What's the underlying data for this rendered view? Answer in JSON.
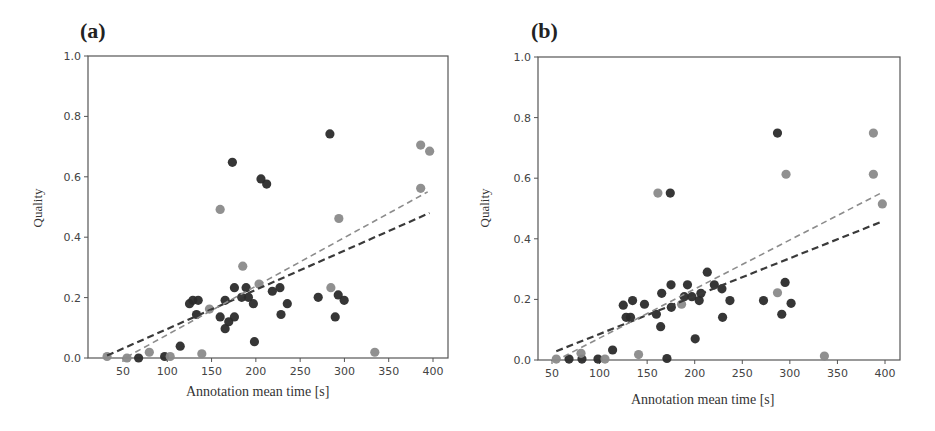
{
  "figure": {
    "panels": [
      {
        "label": "(a)",
        "xlabel": "Annotation mean time [s]",
        "ylabel": "Quality"
      },
      {
        "label": "(b)",
        "xlabel": "Annotation mean time [s]",
        "ylabel": "Quality"
      }
    ]
  },
  "colors": {
    "dark": "#2b2b2b",
    "gray": "#8a8a8a",
    "axis": "#555555"
  },
  "chart_data": [
    {
      "type": "scatter",
      "title": "(a)",
      "xlabel": "Annotation mean time [s]",
      "ylabel": "Quality",
      "xlim": [
        20,
        415
      ],
      "ylim": [
        0.0,
        1.0
      ],
      "xticks": [
        50,
        100,
        150,
        200,
        250,
        300,
        350,
        400
      ],
      "yticks": [
        0.0,
        0.2,
        0.4,
        0.6,
        0.8,
        1.0
      ],
      "grid": false,
      "legend": null,
      "series": [
        {
          "name": "dark",
          "points": [
            [
              283.6,
              0.742
            ],
            [
              173.5,
              0.648
            ],
            [
              205.8,
              0.593
            ],
            [
              212.2,
              0.576
            ],
            [
              114.6,
              0.039
            ],
            [
              125.1,
              0.18
            ],
            [
              128.9,
              0.191
            ],
            [
              134.9,
              0.191
            ],
            [
              133,
              0.144
            ],
            [
              159.7,
              0.136
            ],
            [
              165.3,
              0.097
            ],
            [
              169.4,
              0.12
            ],
            [
              175.8,
              0.136
            ],
            [
              165.3,
              0.191
            ],
            [
              175.8,
              0.233
            ],
            [
              184,
              0.201
            ],
            [
              189,
              0.233
            ],
            [
              191.6,
              0.201
            ],
            [
              197.2,
              0.18
            ],
            [
              198.4,
              0.054
            ],
            [
              218.6,
              0.221
            ],
            [
              227.2,
              0.233
            ],
            [
              228.4,
              0.144
            ],
            [
              235.5,
              0.18
            ],
            [
              270.4,
              0.201
            ],
            [
              293,
              0.209
            ],
            [
              299.7,
              0.191
            ],
            [
              289.6,
              0.136
            ],
            [
              67.6,
              0.0
            ],
            [
              97,
              0.005
            ]
          ]
        },
        {
          "name": "gray",
          "points": [
            [
              147.6,
              0.162
            ],
            [
              159.7,
              0.492
            ],
            [
              185.2,
              0.304
            ],
            [
              203.6,
              0.245
            ],
            [
              284.7,
              0.233
            ],
            [
              293.7,
              0.462
            ],
            [
              386.1,
              0.705
            ],
            [
              396.2,
              0.685
            ],
            [
              386.1,
              0.562
            ],
            [
              334.3,
              0.019
            ],
            [
              139,
              0.014
            ],
            [
              79.7,
              0.019
            ],
            [
              32,
              0.005
            ],
            [
              54.5,
              0.0
            ],
            [
              103.3,
              0.005
            ]
          ]
        }
      ],
      "trendlines": [
        {
          "name": "dark-fit",
          "style": "dashed",
          "from": [
            32,
            0.008
          ],
          "to": [
            396,
            0.48
          ]
        },
        {
          "name": "gray-fit",
          "style": "dashed",
          "from": [
            54,
            0.003
          ],
          "to": [
            394,
            0.55
          ]
        }
      ]
    },
    {
      "type": "scatter",
      "title": "(b)",
      "xlabel": "Annotation mean time [s]",
      "ylabel": "Quality",
      "xlim": [
        40,
        415
      ],
      "ylim": [
        0.0,
        1.0
      ],
      "xticks": [
        50,
        100,
        150,
        200,
        250,
        300,
        350,
        400
      ],
      "yticks": [
        0.0,
        0.2,
        0.4,
        0.6,
        0.8,
        1.0
      ],
      "grid": false,
      "legend": null,
      "series": [
        {
          "name": "dark",
          "points": [
            [
              287,
              0.749
            ],
            [
              174.3,
              0.551
            ],
            [
              113.7,
              0.033
            ],
            [
              124.9,
              0.181
            ],
            [
              134.7,
              0.196
            ],
            [
              127.9,
              0.141
            ],
            [
              132.5,
              0.141
            ],
            [
              147.2,
              0.184
            ],
            [
              159.7,
              0.151
            ],
            [
              164.2,
              0.11
            ],
            [
              165.3,
              0.22
            ],
            [
              175.1,
              0.248
            ],
            [
              175.4,
              0.174
            ],
            [
              189,
              0.209
            ],
            [
              192.4,
              0.248
            ],
            [
              197,
              0.209
            ],
            [
              204.7,
              0.196
            ],
            [
              206.5,
              0.22
            ],
            [
              213.2,
              0.29
            ],
            [
              220.6,
              0.248
            ],
            [
              228.6,
              0.235
            ],
            [
              229.3,
              0.141
            ],
            [
              237,
              0.196
            ],
            [
              200.5,
              0.07
            ],
            [
              170.8,
              0.005
            ],
            [
              272.3,
              0.196
            ],
            [
              295,
              0.256
            ],
            [
              291.5,
              0.151
            ],
            [
              301.3,
              0.187
            ],
            [
              67.9,
              0.003
            ],
            [
              98.3,
              0.003
            ],
            [
              81.5,
              0.003
            ]
          ]
        },
        {
          "name": "gray",
          "points": [
            [
              161.3,
              0.551
            ],
            [
              296,
              0.613
            ],
            [
              387.8,
              0.749
            ],
            [
              387.8,
              0.613
            ],
            [
              397.2,
              0.515
            ],
            [
              287,
              0.222
            ],
            [
              186.2,
              0.184
            ],
            [
              336.3,
              0.013
            ],
            [
              141,
              0.018
            ],
            [
              80.5,
              0.022
            ],
            [
              54.5,
              0.003
            ],
            [
              105.7,
              0.003
            ]
          ]
        }
      ],
      "trendlines": [
        {
          "name": "dark-fit",
          "style": "dashed",
          "from": [
            54.5,
            0.029
          ],
          "to": [
            397,
            0.457
          ]
        },
        {
          "name": "gray-fit",
          "style": "dashed",
          "from": [
            62,
            0.011
          ],
          "to": [
            397,
            0.553
          ]
        }
      ]
    }
  ]
}
